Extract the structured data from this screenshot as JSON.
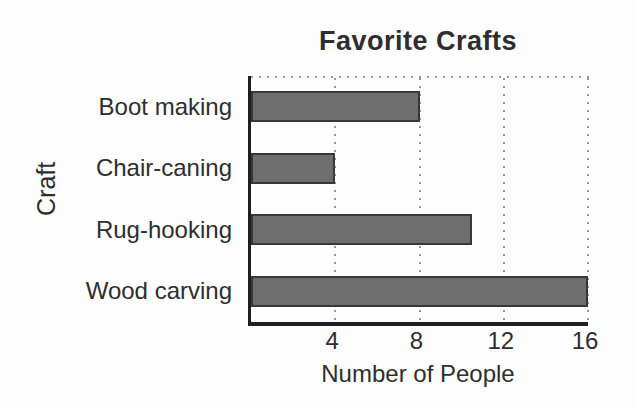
{
  "chart_data": {
    "type": "bar",
    "orientation": "horizontal",
    "title": "Favorite Crafts",
    "categories": [
      "Boot making",
      "Chair-caning",
      "Rug-hooking",
      "Wood carving"
    ],
    "values": [
      8,
      4,
      10.5,
      16
    ],
    "xlabel": "Number of People",
    "ylabel": "Craft",
    "xlim": [
      0,
      16
    ],
    "xticks": [
      4,
      8,
      12,
      16
    ],
    "grid": "dotted-vertical-gridlines-and-dotted-top-frame",
    "legend": "none",
    "colors": {
      "background": "#fdfdfd",
      "bar_fill": "#6e6e6e",
      "bar_border": "#383838",
      "axis": "#1f1f1f",
      "grid_dots": "#969696",
      "text": "#2e2e2e"
    }
  }
}
